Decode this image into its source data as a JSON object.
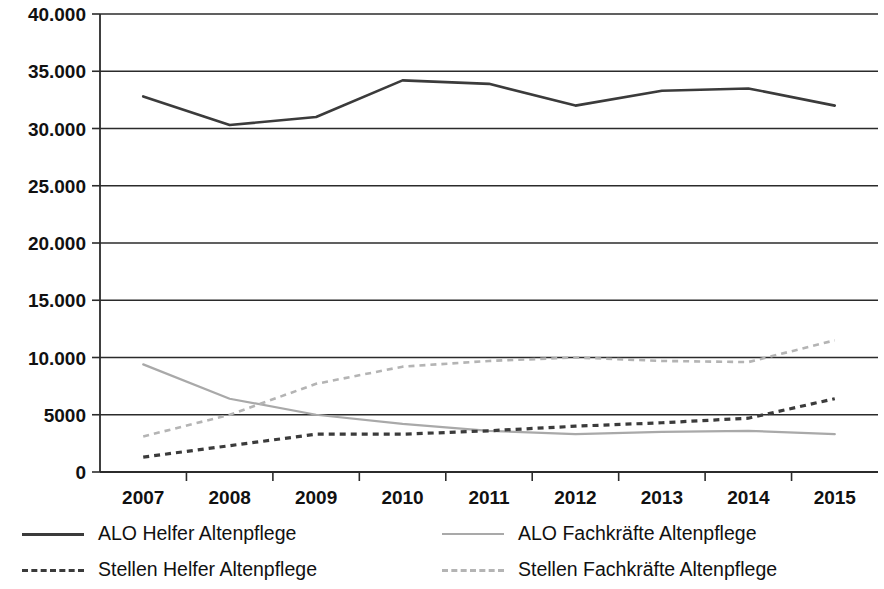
{
  "chart_data": {
    "type": "line",
    "title": "",
    "subtitle": "",
    "xlabel": "",
    "ylabel": "",
    "categories": [
      "2007",
      "2008",
      "2009",
      "2010",
      "2011",
      "2012",
      "2013",
      "2014",
      "2015"
    ],
    "ylim": [
      0,
      40000
    ],
    "ytick_values": [
      0,
      5000,
      10000,
      15000,
      20000,
      25000,
      30000,
      35000,
      40000
    ],
    "ytick_labels": [
      "0",
      "5000",
      "10.000",
      "15.000",
      "20.000",
      "25.000",
      "30.000",
      "35.000",
      "40.000"
    ],
    "grid": true,
    "grid_axis": "y",
    "legend_position": "bottom",
    "series": [
      {
        "name": "ALO Helfer Altenpflege",
        "style": "solid",
        "color": "#3b3b3b",
        "values": [
          32800,
          30300,
          31000,
          34200,
          33900,
          32000,
          33300,
          33500,
          32000
        ]
      },
      {
        "name": "ALO Fachkräfte Altenpflege",
        "style": "solid",
        "color": "#a9a9a9",
        "values": [
          9400,
          6400,
          5000,
          4200,
          3600,
          3300,
          3500,
          3600,
          3300
        ]
      },
      {
        "name": "Stellen Helfer Altenpflege",
        "style": "dashed",
        "color": "#3b3b3b",
        "values": [
          1300,
          2300,
          3300,
          3300,
          3600,
          4000,
          4300,
          4700,
          6400
        ]
      },
      {
        "name": "Stellen Fachkräfte Altenpflege",
        "style": "dashed",
        "color": "#b4b4b4",
        "values": [
          3100,
          5000,
          7700,
          9200,
          9700,
          10000,
          9700,
          9600,
          11500
        ]
      }
    ]
  },
  "legend": {
    "items": [
      {
        "label": "ALO Helfer Altenpflege",
        "swatch": "dark-solid"
      },
      {
        "label": "ALO Fachkräfte Altenpflege",
        "swatch": "light-solid"
      },
      {
        "label": "Stellen Helfer Altenpflege",
        "swatch": "dark-dashed"
      },
      {
        "label": "Stellen Fachkräfte Altenpflege",
        "swatch": "light-dashed"
      }
    ]
  }
}
